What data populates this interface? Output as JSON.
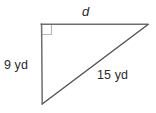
{
  "figure": {
    "type": "right-triangle-geometry-diagram",
    "background_color": "#ffffff",
    "stroke_colors": {
      "legs": "#6e6e6e",
      "hypotenuse": "#555555",
      "right_angle_marker": "#b8b8b8"
    },
    "text_color": "#2b2b2b",
    "vertices": {
      "top_left": {
        "x": 41,
        "y": 24
      },
      "top_right": {
        "x": 148,
        "y": 24
      },
      "bottom_left": {
        "x": 42,
        "y": 104
      }
    },
    "right_angle_marker": {
      "at_vertex": "top_left",
      "size": 10
    },
    "sides": [
      {
        "name": "top-leg",
        "label": "d",
        "italic": true,
        "from": "top_left",
        "to": "top_right"
      },
      {
        "name": "vertical-leg",
        "label": "9 yd",
        "italic": false,
        "from": "top_left",
        "to": "bottom_left"
      },
      {
        "name": "hypotenuse",
        "label": "15 yd",
        "italic": false,
        "from": "bottom_left",
        "to": "top_right"
      }
    ],
    "labels": {
      "unknown_side": "d",
      "vertical_leg": "9 yd",
      "hypotenuse": "15 yd"
    }
  }
}
